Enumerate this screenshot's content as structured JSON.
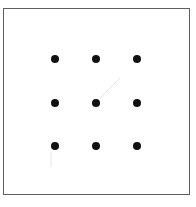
{
  "diagram": {
    "type": "nine-dots-grid",
    "frame": {
      "x": 3,
      "y": 8,
      "width": 187,
      "height": 187,
      "stroke": "#5f5f5f"
    },
    "dot_color": "#111111",
    "dot_radius": 4,
    "columns_x": [
      55,
      96,
      137
    ],
    "rows_y": [
      59,
      103,
      146
    ],
    "dots": [
      {
        "row": 1,
        "col": 1,
        "x": 55,
        "y": 59
      },
      {
        "row": 1,
        "col": 2,
        "x": 96,
        "y": 59
      },
      {
        "row": 1,
        "col": 3,
        "x": 137,
        "y": 59
      },
      {
        "row": 2,
        "col": 1,
        "x": 55,
        "y": 103
      },
      {
        "row": 2,
        "col": 2,
        "x": 96,
        "y": 103
      },
      {
        "row": 2,
        "col": 3,
        "x": 137,
        "y": 103
      },
      {
        "row": 3,
        "col": 1,
        "x": 55,
        "y": 146
      },
      {
        "row": 3,
        "col": 2,
        "x": 96,
        "y": 146
      },
      {
        "row": 3,
        "col": 3,
        "x": 137,
        "y": 146
      }
    ],
    "faint_lines": [
      {
        "x1": 100,
        "y1": 98,
        "x2": 120,
        "y2": 78,
        "color": "#e2e2e2"
      },
      {
        "x1": 51,
        "y1": 152,
        "x2": 51,
        "y2": 167,
        "color": "#e6e6e6"
      }
    ]
  }
}
